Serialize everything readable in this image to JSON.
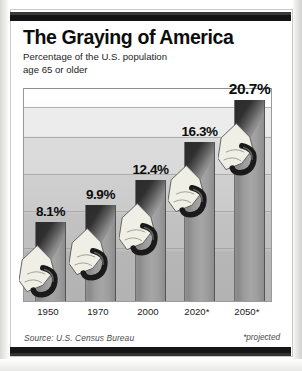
{
  "chart_data": {
    "type": "bar",
    "title": "The Graying of America",
    "subtitle": "Percentage of the U.S. population age 65 or older",
    "categories": [
      "1950",
      "1970",
      "2000",
      "2020*",
      "2050*"
    ],
    "values": [
      8.1,
      9.9,
      12.4,
      16.3,
      20.7
    ],
    "value_labels": [
      "8.1%",
      "9.9%",
      "12.4%",
      "16.3%",
      "20.7%"
    ],
    "xlabel": "",
    "ylabel": "",
    "ylim": [
      0,
      22
    ],
    "grid": true,
    "legend": "none",
    "source": "Source: U.S. Census Bureau",
    "footnote": "*projected",
    "series": [
      {
        "name": "Percentage of U.S. population age 65 or older",
        "values": [
          8.1,
          9.9,
          12.4,
          16.3,
          20.7
        ]
      }
    ],
    "annotations": [
      "Each bar is illustrated with a hand gripping a walking cane."
    ]
  },
  "header": {
    "title": "The Graying of America",
    "subtitle_line1": "Percentage of the U.S. population",
    "subtitle_line2": "age 65 or older"
  },
  "footer": {
    "source": "Source: U.S. Census Bureau",
    "projected_note": "*projected"
  },
  "colors": {
    "rule": "#141414",
    "bar_light": "#a6a6a6",
    "bar_dark": "#2b2b2b",
    "text": "#0d0d0d",
    "plot_top": "#ffffff",
    "plot_bottom": "#b3b3b3",
    "hand": "#efefe6",
    "cane": "#1a1a1a"
  }
}
